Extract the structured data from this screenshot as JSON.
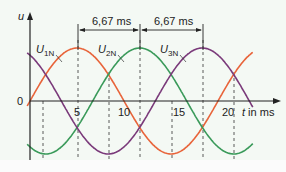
{
  "chart_data": {
    "type": "line",
    "title": "",
    "xlabel": "t in ms",
    "ylabel": "u",
    "x_ticks": [
      "5",
      "10",
      "15",
      "20"
    ],
    "origin_label": "0",
    "series": [
      {
        "name": "U1N",
        "color": "#e8643a",
        "phase_ms": 0,
        "peak_ms": 5
      },
      {
        "name": "U2N",
        "color": "#3a9a5a",
        "phase_ms": 6.67,
        "peak_ms": 11.67
      },
      {
        "name": "U3N",
        "color": "#7a3a7a",
        "phase_ms": 13.33,
        "peak_ms": 18.33
      }
    ],
    "period_ms": 20,
    "annotations": [
      "6,67 ms",
      "6,67 ms"
    ]
  },
  "labels": {
    "u_axis": "u",
    "t_axis": "t in ms",
    "zero": "0",
    "tick5": "5",
    "tick10": "10",
    "tick15": "15",
    "tick20": "20",
    "dim1": "6,67 ms",
    "dim2": "6,67 ms",
    "u1": "U",
    "u1sub": "1N",
    "u2": "U",
    "u2sub": "2N",
    "u3": "U",
    "u3sub": "3N"
  }
}
